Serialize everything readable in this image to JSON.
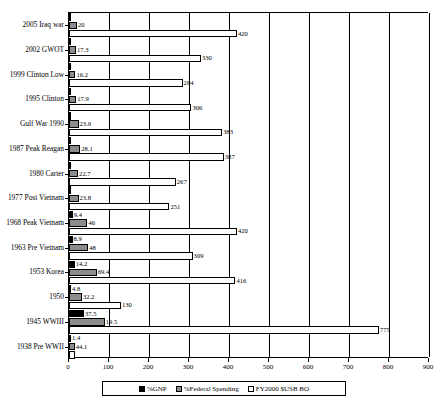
{
  "chart_data": {
    "type": "bar",
    "orientation": "horizontal",
    "title": "",
    "xlabel": "",
    "ylabel": "",
    "xlim": [
      0,
      900
    ],
    "xticks": [
      0,
      100,
      200,
      300,
      400,
      500,
      600,
      700,
      800,
      900
    ],
    "grid": true,
    "grid_axis": "x",
    "legend_position": "bottom",
    "categories": [
      "2005 Iraq war",
      "2002 GWOT",
      "1999 Clinton Low",
      "1995 Clinton",
      "Gulf War 1990",
      "1987 Peak Reagan",
      "1980 Carter",
      "1977 Post Vietnam",
      "1968 Peak Vietnam",
      "1963 Pre Vietnam",
      "1953 Korea",
      "1950",
      "1945 WWIII",
      "1938 Pre WWII"
    ],
    "series": [
      {
        "name": "%GNP",
        "color": "#000000",
        "values": [
          3.9,
          3.4,
          3.0,
          3.7,
          5.2,
          6.1,
          4.9,
          4.9,
          9.4,
          8.9,
          14.2,
          4.8,
          37.5,
          1.4
        ]
      },
      {
        "name": "%Federal Spending",
        "color": "#8c8c8c",
        "values": [
          20.0,
          17.3,
          16.2,
          17.9,
          23.9,
          28.1,
          22.7,
          23.8,
          46.0,
          48.0,
          69.4,
          32.2,
          89.5,
          14.1
        ]
      },
      {
        "name": "FY2000 $USB BO",
        "color": "#ffffff",
        "values": [
          420,
          330,
          284,
          306,
          383,
          387,
          267,
          251,
          420,
          309,
          416,
          130,
          775,
          15
        ]
      }
    ],
    "series_labels": {
      "gnp": [
        [
          "2005 Iraq war",
          ""
        ],
        [
          "2002 GWOT",
          ""
        ],
        [
          "1999 Clinton Low",
          ""
        ],
        [
          "1995 Clinton",
          ""
        ],
        [
          "Gulf War 1990",
          ""
        ],
        [
          "1987 Peak Reagan",
          ""
        ],
        [
          "1980 Carter",
          ""
        ],
        [
          "1977 Post Vietnam",
          ""
        ],
        [
          "1968 Peak Vietnam",
          "9.4"
        ],
        [
          "1963 Pre Vietnam",
          "8.9"
        ],
        [
          "1953 Korea",
          "14.2"
        ],
        [
          "1950",
          "4.8"
        ],
        [
          "1945 WWIII",
          "37.5"
        ],
        [
          "1938 Pre WWII",
          "1.4"
        ]
      ],
      "fed": [
        [
          "2005 Iraq war",
          "20"
        ],
        [
          "2002 GWOT",
          "17.3"
        ],
        [
          "1999 Clinton Low",
          "16.2"
        ],
        [
          "1995 Clinton",
          "17.9"
        ],
        [
          "Gulf War 1990",
          "23.9"
        ],
        [
          "1987 Peak Reagan",
          "28.1"
        ],
        [
          "1980 Carter",
          "22.7"
        ],
        [
          "1977 Post Vietnam",
          "23.8"
        ],
        [
          "1968 Peak Vietnam",
          "46"
        ],
        [
          "1963 Pre Vietnam",
          "48"
        ],
        [
          "1953 Korea",
          "69.4"
        ],
        [
          "1950",
          "32.2"
        ],
        [
          "1945 WWIII",
          "19.5"
        ],
        [
          "1938 Pre WWII",
          "44.1"
        ]
      ],
      "bo": [
        [
          "2005 Iraq war",
          "420"
        ],
        [
          "2002 GWOT",
          "330"
        ],
        [
          "1999 Clinton Low",
          "284"
        ],
        [
          "1995 Clinton",
          "306"
        ],
        [
          "Gulf War 1990",
          "383"
        ],
        [
          "1987 Peak Reagan",
          "387"
        ],
        [
          "1980 Carter",
          "267"
        ],
        [
          "1977 Post Vietnam",
          "251"
        ],
        [
          "1968 Peak Vietnam",
          "420"
        ],
        [
          "1963 Pre Vietnam",
          "309"
        ],
        [
          "1953 Korea",
          "416"
        ],
        [
          "1950",
          "130"
        ],
        [
          "1945 WWIII",
          "775"
        ],
        [
          "1938 Pre WWII",
          ""
        ]
      ]
    }
  },
  "legend": {
    "items": [
      {
        "label": "%GNP",
        "color": "#000000"
      },
      {
        "label": "%Federal Spending",
        "color": "#8c8c8c"
      },
      {
        "label": "FY2000 $USB BO",
        "color": "#ffffff"
      }
    ]
  }
}
